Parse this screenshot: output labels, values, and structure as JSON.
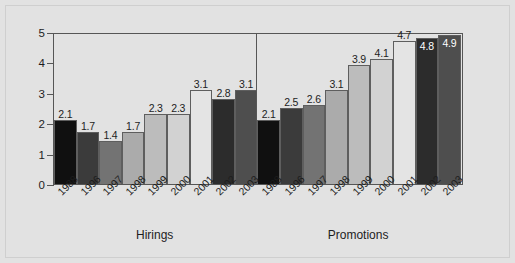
{
  "chart_data": {
    "type": "bar",
    "title": "",
    "subtitle": "",
    "xlabel": "",
    "ylabel": "",
    "ylim": [
      0,
      5
    ],
    "yticks": [
      "0",
      "1",
      "2",
      "3",
      "4",
      "5"
    ],
    "grid": false,
    "legend": "none",
    "categories": [
      "1988",
      "1996",
      "1997",
      "1998",
      "1999",
      "2000",
      "2001",
      "2002",
      "2003"
    ],
    "groups": [
      {
        "name": "Hirings",
        "caption": "Hirings",
        "categories": [
          "1988",
          "1996",
          "1997",
          "1998",
          "1999",
          "2000",
          "2001",
          "2002",
          "2003"
        ],
        "values": [
          2.1,
          1.7,
          1.4,
          1.7,
          2.3,
          2.3,
          3.1,
          2.8,
          3.1
        ],
        "value_labels": [
          "2.1",
          "1.7",
          "1.4",
          "1.7",
          "2.3",
          "2.3",
          "3.1",
          "2.8",
          "3.1"
        ],
        "bar_colors": [
          "#101010",
          "#3b3b3b",
          "#737373",
          "#ababab",
          "#bcbcbc",
          "#d2d2d2",
          "#e4e4e4",
          "#2c2c2c",
          "#4e4e4e"
        ],
        "label_inside": [
          false,
          false,
          false,
          false,
          false,
          false,
          false,
          false,
          false
        ]
      },
      {
        "name": "Promotions",
        "caption": "Promotions",
        "categories": [
          "1988",
          "1996",
          "1997",
          "1998",
          "1999",
          "2000",
          "2001",
          "2002",
          "2003"
        ],
        "values": [
          2.1,
          2.5,
          2.6,
          3.1,
          3.9,
          4.1,
          4.7,
          4.8,
          4.9
        ],
        "value_labels": [
          "2.1",
          "2.5",
          "2.6",
          "3.1",
          "3.9",
          "4.1",
          "4.7",
          "4.8",
          "4.9"
        ],
        "bar_colors": [
          "#101010",
          "#3b3b3b",
          "#737373",
          "#ababab",
          "#bcbcbc",
          "#d2d2d2",
          "#e4e4e4",
          "#2c2c2c",
          "#4e4e4e"
        ],
        "label_inside": [
          false,
          false,
          false,
          false,
          false,
          false,
          false,
          true,
          true
        ]
      }
    ],
    "colors": {
      "background": "#e2e2e2",
      "axis": "#565656",
      "bar_outline": "#5e5e5e",
      "text": "#1d1d1d",
      "label_inside_text": "#ffffff"
    }
  }
}
